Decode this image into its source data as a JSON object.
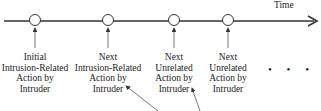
{
  "diagram": {
    "axis_label": "Time",
    "events": [
      {
        "lines": [
          "Initial",
          "Intrusion-Related",
          "Action by",
          "Intruder"
        ]
      },
      {
        "lines": [
          "Next",
          "Intrusion-Related",
          "Action by",
          "Intruder"
        ]
      },
      {
        "lines": [
          "Next",
          "Unrelated",
          "Action by",
          "Intruder"
        ]
      },
      {
        "lines": [
          "Next",
          "Unrelated",
          "Action by",
          "Intruder"
        ]
      }
    ],
    "continuation": "• • •",
    "colors": {
      "line": "#333333",
      "node_fill": "#ffffff",
      "text": "#222222"
    }
  }
}
